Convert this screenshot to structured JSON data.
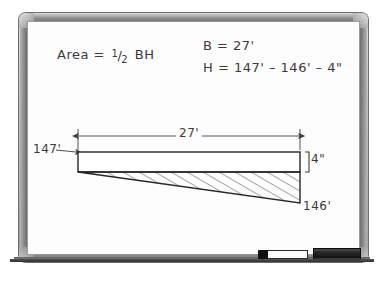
{
  "board": {
    "surface_color": "#fdfdfd",
    "frame_color": "#9d9d9d",
    "ink_color": "#3a3a3a"
  },
  "notes": {
    "area_formula": {
      "lead": "Area = ",
      "numerator": "1",
      "slash": "/",
      "denominator": "2",
      "tail": " BH"
    },
    "base_equation": "B = 27'",
    "height_equation": "H = 147' – 146' – 4\""
  },
  "diagram": {
    "dimension_label_width": "27'",
    "label_top_left_elevation": "147'",
    "label_bottom_right_elevation": "146'",
    "label_thickness": "4\"",
    "shapes": {
      "slab_rectangle": {
        "left": 78,
        "top": 152,
        "right": 300,
        "bottom": 172
      },
      "wedge_triangle": {
        "apex_x": 78,
        "apex_y": 172,
        "right_top_x": 300,
        "right_top_y": 172,
        "right_bottom_x": 300,
        "right_bottom_y": 203
      },
      "hatch_spacing": 8,
      "hatch_angle_deg": 60
    }
  },
  "tray": {
    "marker_label": "whiteboard-marker",
    "eraser_label": "whiteboard-eraser"
  }
}
